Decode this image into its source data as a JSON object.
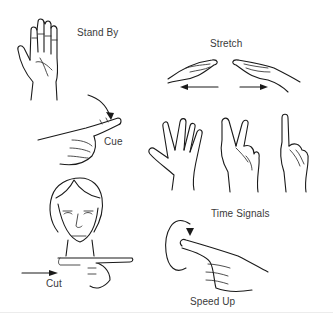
{
  "signals": [
    {
      "id": "stand-by",
      "label": "Stand By"
    },
    {
      "id": "stretch",
      "label": "Stretch"
    },
    {
      "id": "cue",
      "label": "Cue"
    },
    {
      "id": "time-signals",
      "label": "Time Signals"
    },
    {
      "id": "cut",
      "label": "Cut"
    },
    {
      "id": "speed-up",
      "label": "Speed Up"
    }
  ],
  "colors": {
    "line": "#1a1a1a",
    "text": "#3a3a3a",
    "background": "#ffffff"
  }
}
